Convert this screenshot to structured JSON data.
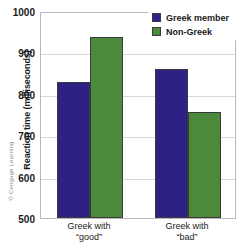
{
  "credit": "© Cengage Learning",
  "chart_data": {
    "type": "bar",
    "title": "",
    "xlabel": "",
    "ylabel": "Reaction time (milliseconds)",
    "ylim": [
      500,
      1000
    ],
    "ytick_labels": [
      "1000",
      "900",
      "800",
      "700",
      "600",
      "500"
    ],
    "ytick_values": [
      1000,
      900,
      800,
      700,
      600,
      500
    ],
    "grid": true,
    "legend_position": "top-right",
    "categories": [
      "Greek with “good”",
      "Greek with “bad”"
    ],
    "category_lines": [
      {
        "line1": "Greek with",
        "line2": "“good”"
      },
      {
        "line1": "Greek with",
        "line2": "“bad”"
      }
    ],
    "series": [
      {
        "name": "Greek member",
        "color": "#2E2185",
        "values": [
          828,
          860
        ]
      },
      {
        "name": "Non-Greek",
        "color": "#4A8A3A",
        "values": [
          938,
          756
        ]
      }
    ]
  }
}
